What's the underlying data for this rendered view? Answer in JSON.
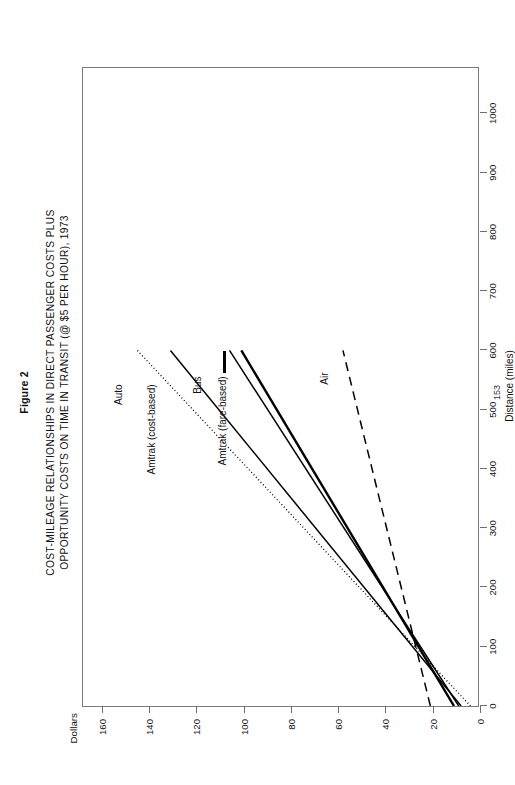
{
  "figure": {
    "label": "Figure 2",
    "title_line1": "COST-MILEAGE RELATIONSHIPS IN DIRECT PASSENGER COSTS PLUS",
    "title_line2": "OPPORTUNITY COSTS ON TIME IN TRANSIT (@ $5 PER HOUR), 1973",
    "page_number": "153"
  },
  "chart_data": {
    "type": "line",
    "title": "COST-MILEAGE RELATIONSHIPS IN DIRECT PASSENGER COSTS PLUS OPPORTUNITY COSTS ON TIME IN TRANSIT (@ $5 PER HOUR), 1973",
    "subtitle": "Figure 2",
    "xlabel": "Distance (miles)",
    "ylabel": "Dollars",
    "xlim": [
      0,
      1080
    ],
    "ylim": [
      0,
      168
    ],
    "grid": false,
    "legend": "inline-annotations",
    "xticks": [
      0,
      100,
      200,
      300,
      400,
      500,
      600,
      700,
      800,
      900,
      1000
    ],
    "xticklabels": [
      "0",
      "100",
      "200",
      "300",
      "400",
      "500",
      "600",
      "700",
      "800",
      "900",
      "1000"
    ],
    "yticks": [
      0,
      20,
      40,
      60,
      80,
      100,
      120,
      140,
      160
    ],
    "yticklabels": [
      "0",
      "20",
      "40",
      "60",
      "80",
      "100",
      "120",
      "140",
      "160"
    ],
    "series": [
      {
        "name": "Auto",
        "style": "dotted",
        "x": [
          0,
          600
        ],
        "y": [
          4,
          145
        ]
      },
      {
        "name": "Amtrak (cost-based)",
        "style": "solid",
        "x": [
          0,
          600
        ],
        "y": [
          8,
          131
        ]
      },
      {
        "name": "Bus",
        "style": "solid",
        "x": [
          0,
          600
        ],
        "y": [
          9,
          106
        ]
      },
      {
        "name": "Amtrak (fare-based)",
        "style": "solid-thick",
        "x": [
          0,
          600
        ],
        "y": [
          11,
          101
        ]
      },
      {
        "name": "Air",
        "style": "dashed",
        "x": [
          0,
          600
        ],
        "y": [
          21,
          58
        ]
      }
    ]
  },
  "annotations": [
    {
      "label": "Auto"
    },
    {
      "label": "Amtrak (cost-based)"
    },
    {
      "label": "Bus"
    },
    {
      "label": "Amtrak (fare-based)"
    },
    {
      "label": "Air"
    }
  ]
}
